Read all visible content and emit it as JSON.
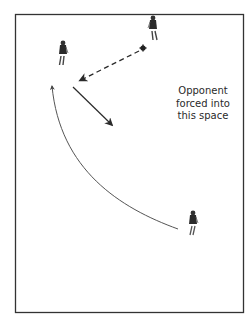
{
  "diagram": {
    "title": "",
    "annotation": {
      "lines": [
        "Opponent",
        "forced into",
        "this space"
      ]
    },
    "field": {
      "border_color": "#333333",
      "background": "#ffffff",
      "x": 15,
      "y": 14,
      "width": 228,
      "height": 298
    },
    "players": [
      {
        "id": "player-top-left",
        "x": 63,
        "y": 55
      },
      {
        "id": "player-top-right",
        "x": 153,
        "y": 30
      },
      {
        "id": "player-bottom-right",
        "x": 193,
        "y": 225
      }
    ],
    "ball": {
      "x": 143,
      "y": 48,
      "symbol": "plus"
    },
    "arrows": [
      {
        "id": "pass-arrow",
        "style": "dashed",
        "from": [
          139,
          51
        ],
        "to": [
          79,
          81
        ]
      },
      {
        "id": "forcing-arrow",
        "style": "solid",
        "from": [
          73,
          87
        ],
        "to": [
          113,
          126
        ]
      },
      {
        "id": "run-arrow",
        "style": "solid-curved",
        "from": [
          178,
          229
        ],
        "to": [
          52,
          84
        ]
      }
    ],
    "colors": {
      "ink": "#2a2a2a",
      "line": "#333333",
      "curve": "#444444"
    }
  }
}
